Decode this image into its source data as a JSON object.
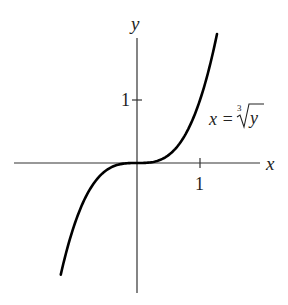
{
  "chart_data": {
    "type": "line",
    "title": "",
    "xlabel": "x",
    "ylabel": "y",
    "xlim": [
      -1.95,
      1.95
    ],
    "ylim": [
      -2.1,
      2.0
    ],
    "grid": false,
    "legend": null,
    "x_ticks": [
      {
        "value": 1,
        "label": "1"
      }
    ],
    "y_ticks": [
      {
        "value": 1,
        "label": "1"
      }
    ],
    "annotations": [
      {
        "text": "x = ∛y",
        "x_pos": 1.1,
        "y_pos": 0.55
      }
    ],
    "series": [
      {
        "name": "x = ∛y",
        "equation": "y = x^3",
        "x": [
          -1.21,
          -1.0,
          -0.8,
          -0.6,
          -0.4,
          -0.2,
          0,
          0.2,
          0.4,
          0.6,
          0.8,
          1.0,
          1.2,
          1.27
        ],
        "values": [
          -1.77,
          -1.0,
          -0.51,
          -0.22,
          -0.06,
          -0.01,
          0,
          0.01,
          0.06,
          0.22,
          0.51,
          1.0,
          1.73,
          2.05
        ]
      }
    ]
  },
  "labels": {
    "x_axis": "x",
    "y_axis": "y",
    "x_tick_1": "1",
    "y_tick_1": "1",
    "curve_label_lhs": "x = ",
    "curve_label_root_index": "3",
    "curve_label_radicand": "y"
  },
  "colors": {
    "axis": "#333333",
    "curve": "#000000",
    "background": "#ffffff"
  }
}
